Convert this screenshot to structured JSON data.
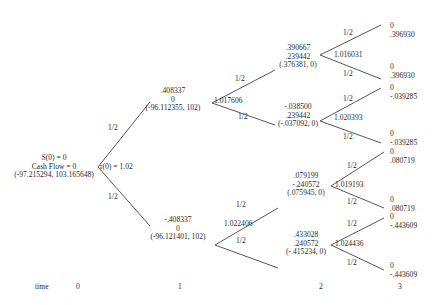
{
  "root": {
    "line1": "S(0) = 0",
    "line2": "Cash Flow = 0",
    "line3": "(-97.215294, 103.165648)",
    "rate": "r(0) = 1.02",
    "prob_up": "1/2",
    "prob_down": "1/2"
  },
  "t1": {
    "up": {
      "line1": ".408337",
      "line2": "0",
      "line3": "(-96.112355, 102)",
      "rate": "1.017606",
      "prob_up": "1/2",
      "prob_down": "1/2"
    },
    "down": {
      "line1": "-.408337",
      "line2": "0",
      "line3": "(-96.121401, 102)",
      "rate": "1.022406",
      "prob_up": "1/2",
      "prob_down": "1/2"
    }
  },
  "t2": {
    "uu": {
      "line1": ".390667",
      "line2": ".239442",
      "line3": "(.376381, 0)",
      "rate": "1.016031",
      "prob_up": "1/2",
      "prob_down": "1/2"
    },
    "ud": {
      "line1": "-.038500",
      "line2": ".239442",
      "line3": "(-.037092, 0)",
      "rate": "1.020393",
      "prob_up": "1/2",
      "prob_down": "1/2"
    },
    "du": {
      "line1": ".079199",
      "line2": "-.240572",
      "line3": "(.075945, 0)",
      "rate": "1.019193",
      "prob_up": "1/2",
      "prob_down": "1/2"
    },
    "dd": {
      "line1": ".433028",
      "line2": ".240572",
      "line3": "(-.415234, 0)",
      "rate": "1.024436",
      "prob_up": "1/2",
      "prob_down": "1/2"
    }
  },
  "t3": [
    {
      "line1": "0",
      "line2": ".396930"
    },
    {
      "line1": "0",
      "line2": ".396930"
    },
    {
      "line1": "0",
      "line2": "-.039285"
    },
    {
      "line1": "0",
      "line2": "-.039285"
    },
    {
      "line1": "0",
      "line2": ".080719"
    },
    {
      "line1": "0",
      "line2": ".080719"
    },
    {
      "line1": "0",
      "line2": "-.443609"
    },
    {
      "line1": "0",
      "line2": "-.443609"
    }
  ],
  "time_axis": {
    "label": "time",
    "ticks": [
      "0",
      "1",
      "2",
      "3"
    ]
  }
}
